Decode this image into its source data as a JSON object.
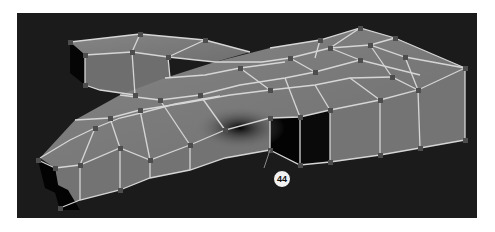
{
  "figure": {
    "background_color": "#1b1b1b",
    "face_color": "#7a7a7a",
    "edge_color": "#d8d8d8",
    "vertex_color": "#4a4a4a"
  },
  "callout": {
    "label": "44"
  }
}
